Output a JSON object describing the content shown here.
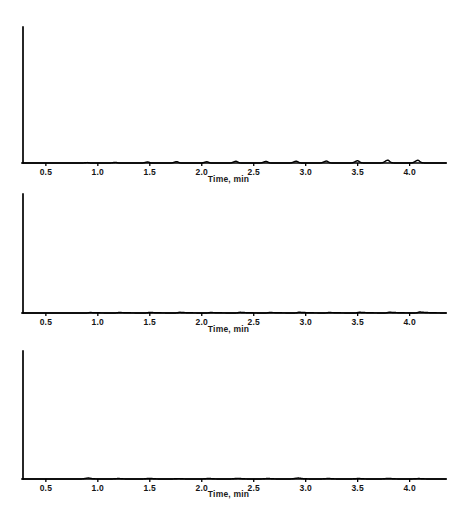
{
  "figure": {
    "kind": "chromatogram-figure",
    "panel_count": 3,
    "background_color": "#ffffff",
    "trace_color": "#000000"
  },
  "axis": {
    "label": "Time, min",
    "tick_labels": [
      "0.5",
      "1.0",
      "1.5",
      "2.0",
      "2.5",
      "3.0",
      "3.5",
      "4.0"
    ],
    "tick_values": [
      0.5,
      1.0,
      1.5,
      2.0,
      2.5,
      3.0,
      3.5,
      4.0
    ],
    "x_min": 0.28,
    "x_max": 4.35
  },
  "panels": {
    "panel_a": {
      "label": "Time, min"
    },
    "panel_b": {
      "label": "Time, min"
    },
    "panel_c": {
      "label": "Time, min"
    }
  },
  "chart_data": [
    {
      "type": "line",
      "title": "",
      "subtitle": "Top chromatogram - sharp symmetric peaks, increasing response",
      "xlabel": "Time, min",
      "ylabel": "",
      "xlim": [
        0.28,
        4.35
      ],
      "ylim": [
        0,
        1.0
      ],
      "grid": false,
      "legend": "none",
      "xticks": [
        0.5,
        1.0,
        1.5,
        2.0,
        2.5,
        3.0,
        3.5,
        4.0
      ],
      "xticklabels": [
        "0.5",
        "1.0",
        "1.5",
        "2.0",
        "2.5",
        "3.0",
        "3.5",
        "4.0"
      ],
      "peaks": [
        {
          "rt": 0.9,
          "height": 0.135,
          "width": 0.022,
          "tail": 0.012
        },
        {
          "rt": 1.17,
          "height": 0.205,
          "width": 0.022,
          "tail": 0.012
        },
        {
          "rt": 1.48,
          "height": 0.33,
          "width": 0.022,
          "tail": 0.013
        },
        {
          "rt": 1.76,
          "height": 0.45,
          "width": 0.022,
          "tail": 0.013
        },
        {
          "rt": 2.05,
          "height": 0.395,
          "width": 0.023,
          "tail": 0.014
        },
        {
          "rt": 2.33,
          "height": 0.565,
          "width": 0.023,
          "tail": 0.015
        },
        {
          "rt": 2.62,
          "height": 0.53,
          "width": 0.023,
          "tail": 0.015
        },
        {
          "rt": 2.91,
          "height": 0.6,
          "width": 0.024,
          "tail": 0.016
        },
        {
          "rt": 3.2,
          "height": 0.64,
          "width": 0.024,
          "tail": 0.016
        },
        {
          "rt": 3.5,
          "height": 0.74,
          "width": 0.024,
          "tail": 0.017
        },
        {
          "rt": 3.79,
          "height": 0.94,
          "width": 0.025,
          "tail": 0.017
        },
        {
          "rt": 4.08,
          "height": 0.9,
          "width": 0.025,
          "tail": 0.018
        }
      ]
    },
    {
      "type": "line",
      "title": "",
      "subtitle": "Middle chromatogram - tailing peaks of similar width",
      "xlabel": "Time, min",
      "ylabel": "",
      "xlim": [
        0.28,
        4.35
      ],
      "ylim": [
        0,
        1.0
      ],
      "grid": false,
      "legend": "none",
      "xticks": [
        0.5,
        1.0,
        1.5,
        2.0,
        2.5,
        3.0,
        3.5,
        4.0
      ],
      "xticklabels": [
        "0.5",
        "1.0",
        "1.5",
        "2.0",
        "2.5",
        "3.0",
        "3.5",
        "4.0"
      ],
      "peaks": [
        {
          "rt": 0.93,
          "height": 0.465,
          "width": 0.018,
          "tail": 0.085
        },
        {
          "rt": 1.21,
          "height": 0.53,
          "width": 0.018,
          "tail": 0.085
        },
        {
          "rt": 1.5,
          "height": 0.57,
          "width": 0.018,
          "tail": 0.085
        },
        {
          "rt": 1.79,
          "height": 0.66,
          "width": 0.018,
          "tail": 0.085
        },
        {
          "rt": 2.09,
          "height": 0.505,
          "width": 0.018,
          "tail": 0.085
        },
        {
          "rt": 2.37,
          "height": 0.66,
          "width": 0.018,
          "tail": 0.085
        },
        {
          "rt": 2.66,
          "height": 0.545,
          "width": 0.018,
          "tail": 0.085
        },
        {
          "rt": 2.94,
          "height": 0.775,
          "width": 0.018,
          "tail": 0.085
        },
        {
          "rt": 3.23,
          "height": 0.52,
          "width": 0.018,
          "tail": 0.085
        },
        {
          "rt": 3.52,
          "height": 0.725,
          "width": 0.018,
          "tail": 0.085
        },
        {
          "rt": 3.81,
          "height": 0.79,
          "width": 0.018,
          "tail": 0.085
        },
        {
          "rt": 4.1,
          "height": 0.975,
          "width": 0.018,
          "tail": 0.085
        }
      ]
    },
    {
      "type": "line",
      "title": "",
      "subtitle": "Bottom chromatogram - broad peaks with variable response",
      "xlabel": "Time, min",
      "ylabel": "",
      "xlim": [
        0.28,
        4.35
      ],
      "ylim": [
        0,
        1.0
      ],
      "grid": false,
      "legend": "none",
      "xticks": [
        0.5,
        1.0,
        1.5,
        2.0,
        2.5,
        3.0,
        3.5,
        4.0
      ],
      "xticklabels": [
        "0.5",
        "1.0",
        "1.5",
        "2.0",
        "2.5",
        "3.0",
        "3.5",
        "4.0"
      ],
      "peaks": [
        {
          "rt": 0.91,
          "height": 0.96,
          "width": 0.03,
          "tail": 0.035
        },
        {
          "rt": 1.2,
          "height": 0.445,
          "width": 0.033,
          "tail": 0.04
        },
        {
          "rt": 1.5,
          "height": 0.62,
          "width": 0.033,
          "tail": 0.042
        },
        {
          "rt": 1.78,
          "height": 0.385,
          "width": 0.035,
          "tail": 0.044
        },
        {
          "rt": 2.07,
          "height": 0.5,
          "width": 0.035,
          "tail": 0.045
        },
        {
          "rt": 2.35,
          "height": 0.645,
          "width": 0.035,
          "tail": 0.046
        },
        {
          "rt": 2.64,
          "height": 0.485,
          "width": 0.036,
          "tail": 0.047
        },
        {
          "rt": 2.93,
          "height": 0.935,
          "width": 0.034,
          "tail": 0.046
        },
        {
          "rt": 3.22,
          "height": 0.47,
          "width": 0.036,
          "tail": 0.048
        },
        {
          "rt": 3.51,
          "height": 0.46,
          "width": 0.036,
          "tail": 0.048
        },
        {
          "rt": 3.8,
          "height": 0.57,
          "width": 0.036,
          "tail": 0.049
        },
        {
          "rt": 4.09,
          "height": 0.425,
          "width": 0.036,
          "tail": 0.05
        }
      ]
    }
  ]
}
